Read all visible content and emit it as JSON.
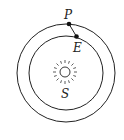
{
  "diagram": {
    "type": "orbital-diagram",
    "labels": {
      "planet": "P",
      "earth": "E",
      "sun": "S"
    },
    "colors": {
      "stroke": "#222222",
      "background": "#ffffff"
    },
    "orbits": [
      {
        "name": "outer-orbit",
        "label": "P"
      },
      {
        "name": "inner-orbit",
        "label": "E"
      }
    ]
  }
}
